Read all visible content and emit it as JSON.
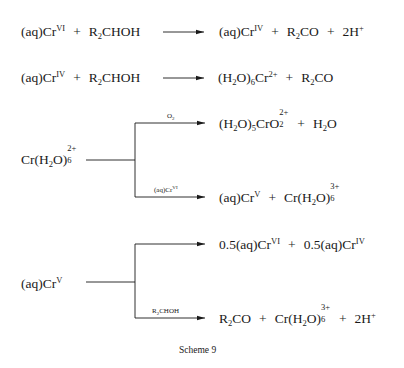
{
  "scheme": {
    "caption": "Scheme 9",
    "reactions": [
      {
        "id": "r1",
        "reactants": [
          {
            "base": "(aq)Cr",
            "sup": "VI"
          },
          {
            "base": "R",
            "sub": "2",
            "rest": "CHOH"
          }
        ],
        "products": [
          {
            "base": "(aq)Cr",
            "sup": "IV"
          },
          {
            "base": "R",
            "sub": "2",
            "rest": "CO"
          },
          {
            "base": "2H",
            "sup": "+"
          }
        ]
      },
      {
        "id": "r2",
        "reactants": [
          {
            "base": "(aq)Cr",
            "sup": "IV"
          },
          {
            "base": "R",
            "sub": "2",
            "rest": "CHOH"
          }
        ],
        "products": [
          {
            "formula": "(H2O)6Cr",
            "sup": "2+"
          },
          {
            "base": "R",
            "sub": "2",
            "rest": "CO"
          }
        ]
      }
    ],
    "branches": [
      {
        "id": "b1",
        "reactant": {
          "formula": "Cr(H2O)6",
          "sup": "2+"
        },
        "upper": {
          "condition": "O2",
          "products": [
            {
              "formula": "(H2O)5CrO2",
              "sup": "2+"
            },
            {
              "formula": "H2O"
            }
          ]
        },
        "lower": {
          "condition": "(aq)CrVI",
          "products": [
            {
              "base": "(aq)Cr",
              "sup": "V"
            },
            {
              "formula": "Cr(H2O)6",
              "sup": "3+"
            }
          ]
        }
      },
      {
        "id": "b2",
        "reactant": {
          "base": "(aq)Cr",
          "sup": "V"
        },
        "upper": {
          "condition": "",
          "products": [
            {
              "coef": "0.5",
              "base": "(aq)Cr",
              "sup": "VI"
            },
            {
              "coef": "0.5",
              "base": "(aq)Cr",
              "sup": "IV"
            }
          ]
        },
        "lower": {
          "condition": "R2CHOH",
          "products": [
            {
              "formula": "R2CO"
            },
            {
              "formula": "Cr(H2O)6",
              "sup": "3+"
            },
            {
              "base": "2H",
              "sup": "+"
            }
          ]
        }
      }
    ]
  },
  "text": {
    "plus": "+",
    "aqcr": "(aq)Cr",
    "VI": "VI",
    "IV": "IV",
    "V": "V",
    "R": "R",
    "two": "2",
    "chOH": "CHOH",
    "CO": "CO",
    "twoH": "2H",
    "plusCharge": "+",
    "twoPlus": "2+",
    "threePlus": "3+",
    "H": "H",
    "O": "O",
    "Cr": "Cr",
    "five": "5",
    "six": "6",
    "lp": "(",
    "rp": ")",
    "crLp": "Cr(",
    "crO": "CrO",
    "half": "0.5",
    "O2cond_O": "O",
    "caption": "Scheme 9"
  }
}
